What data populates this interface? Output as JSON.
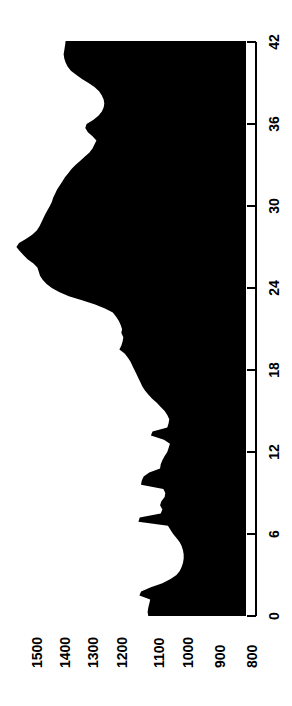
{
  "figure": {
    "name": "rotated-area-profile-plot",
    "orientation": "rotated-90-ccw",
    "background_color": "#ffffff",
    "fill_color": "#000000",
    "axis_color": "#000000"
  },
  "value_axis": {
    "name": "value-axis",
    "tick_labels": [
      "1500",
      "1400",
      "1300",
      "1200",
      "1100",
      "1000",
      "900",
      "800"
    ],
    "tick_values": [
      1500,
      1400,
      1300,
      1200,
      1100,
      1000,
      900,
      800
    ],
    "tick_x_positions": [
      30,
      58,
      86,
      115,
      152,
      181,
      213,
      245
    ],
    "direction": "decreasing-left-to-right"
  },
  "category_axis": {
    "name": "category-axis",
    "tick_labels": [
      "42",
      "36",
      "30",
      "24",
      "18",
      "12",
      "6",
      "0"
    ],
    "tick_values": [
      42,
      36,
      30,
      24,
      18,
      12,
      6,
      0
    ],
    "tick_y_positions": [
      42,
      124,
      206,
      288,
      370,
      452,
      534,
      616
    ],
    "direction": "decreasing-top-to-bottom"
  },
  "chart_data": {
    "type": "area",
    "title": "",
    "subtitle": "",
    "xlabel": "",
    "ylabel": "",
    "orientation": "horizontal",
    "grid": false,
    "legend": null,
    "legend_position": null,
    "xlim": [
      0,
      42
    ],
    "ylim": [
      800,
      1550
    ],
    "x_ticks": [
      0,
      6,
      12,
      18,
      24,
      30,
      36,
      42
    ],
    "y_ticks": [
      800,
      900,
      1000,
      1100,
      1200,
      1300,
      1400,
      1500
    ],
    "fill_color": "#000000",
    "baseline": 800,
    "x": [
      0.0,
      0.3,
      0.6,
      0.9,
      1.2,
      1.5,
      1.8,
      2.1,
      2.4,
      2.7,
      3.0,
      3.3,
      3.6,
      3.9,
      4.2,
      4.5,
      4.8,
      5.1,
      5.4,
      5.7,
      6.0,
      6.3,
      6.6,
      6.9,
      7.2,
      7.5,
      7.8,
      8.1,
      8.4,
      8.7,
      9.0,
      9.3,
      9.6,
      9.9,
      10.2,
      10.5,
      10.8,
      11.1,
      11.4,
      11.7,
      12.0,
      12.3,
      12.6,
      12.9,
      13.2,
      13.5,
      13.8,
      14.1,
      14.4,
      14.7,
      15.0,
      15.3,
      15.6,
      15.9,
      16.2,
      16.5,
      16.8,
      17.1,
      17.4,
      17.7,
      18.0,
      18.3,
      18.6,
      18.9,
      19.2,
      19.5,
      19.8,
      20.1,
      20.4,
      20.7,
      21.0,
      21.3,
      21.6,
      21.9,
      22.2,
      22.5,
      22.8,
      23.1,
      23.4,
      23.7,
      24.0,
      24.3,
      24.6,
      24.9,
      25.2,
      25.5,
      25.8,
      26.1,
      26.4,
      26.7,
      27.0,
      27.3,
      27.6,
      27.9,
      28.2,
      28.5,
      28.8,
      29.1,
      29.4,
      29.7,
      30.0,
      30.3,
      30.6,
      30.9,
      31.2,
      31.5,
      31.8,
      32.1,
      32.4,
      32.7,
      33.0,
      33.3,
      33.6,
      33.9,
      34.2,
      34.5,
      34.8,
      35.1,
      35.4,
      35.7,
      36.0,
      36.3,
      36.6,
      36.9,
      37.2,
      37.5,
      37.8,
      38.1,
      38.4,
      38.7,
      39.0,
      39.3,
      39.6,
      39.9,
      40.2,
      40.5,
      40.8,
      41.1,
      41.4,
      41.7,
      42.0
    ],
    "values": [
      1098,
      1100,
      1098,
      1095,
      1092,
      1125,
      1120,
      1090,
      1055,
      1030,
      1012,
      1002,
      996,
      992,
      990,
      990,
      992,
      996,
      1002,
      1012,
      1022,
      1030,
      1038,
      1128,
      1124,
      1060,
      1055,
      1062,
      1058,
      1048,
      1046,
      1052,
      1120,
      1118,
      1112,
      1095,
      1062,
      1060,
      1055,
      1048,
      1040,
      1036,
      1032,
      1050,
      1090,
      1085,
      1040,
      1036,
      1034,
      1040,
      1048,
      1060,
      1072,
      1086,
      1098,
      1108,
      1116,
      1122,
      1128,
      1134,
      1140,
      1146,
      1152,
      1160,
      1170,
      1186,
      1180,
      1176,
      1174,
      1180,
      1178,
      1182,
      1188,
      1196,
      1206,
      1230,
      1260,
      1300,
      1340,
      1370,
      1392,
      1408,
      1420,
      1428,
      1432,
      1436,
      1448,
      1466,
      1478,
      1490,
      1500,
      1492,
      1470,
      1452,
      1438,
      1430,
      1424,
      1418,
      1412,
      1405,
      1398,
      1392,
      1388,
      1382,
      1376,
      1368,
      1360,
      1352,
      1342,
      1332,
      1320,
      1306,
      1292,
      1278,
      1268,
      1262,
      1256,
      1268,
      1282,
      1290,
      1286,
      1266,
      1250,
      1240,
      1234,
      1232,
      1234,
      1240,
      1248,
      1262,
      1280,
      1300,
      1318,
      1334,
      1344,
      1350,
      1354,
      1356,
      1354,
      1352,
      1350
    ]
  }
}
